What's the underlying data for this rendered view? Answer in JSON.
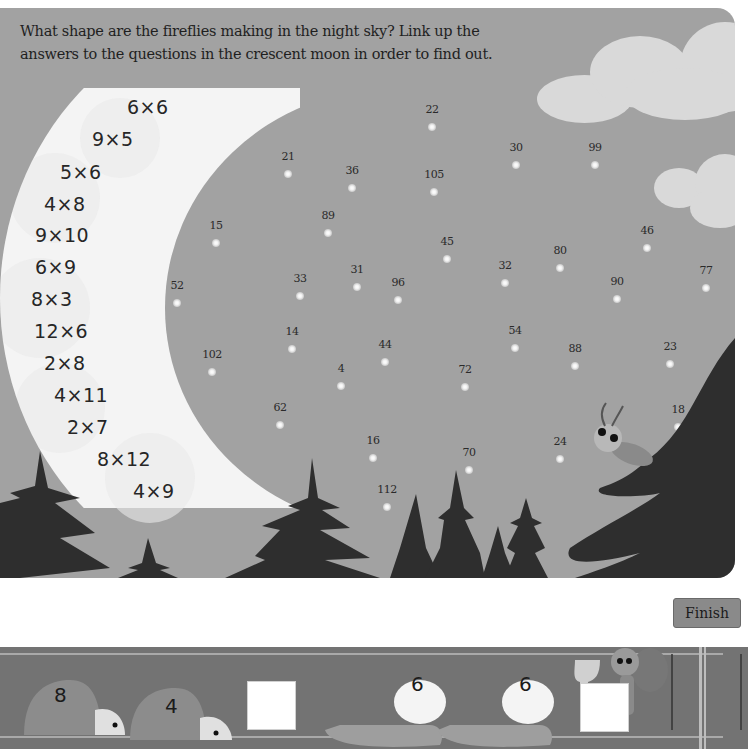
{
  "instructions": {
    "line1": "What shape are the fireflies making in the night sky? Link up the",
    "line2": "answers to the questions in the crescent moon in order to find out."
  },
  "moon_questions": [
    {
      "text": "6×6",
      "x": 127,
      "y": 108
    },
    {
      "text": "9×5",
      "x": 92,
      "y": 140
    },
    {
      "text": "5×6",
      "x": 60,
      "y": 173
    },
    {
      "text": "4×8",
      "x": 44,
      "y": 205
    },
    {
      "text": "9×10",
      "x": 35,
      "y": 236
    },
    {
      "text": "6×9",
      "x": 35,
      "y": 268
    },
    {
      "text": "8×3",
      "x": 31,
      "y": 300
    },
    {
      "text": "12×6",
      "x": 34,
      "y": 332
    },
    {
      "text": "2×8",
      "x": 44,
      "y": 364
    },
    {
      "text": "4×11",
      "x": 54,
      "y": 396
    },
    {
      "text": "2×7",
      "x": 67,
      "y": 428
    },
    {
      "text": "8×12",
      "x": 97,
      "y": 460
    },
    {
      "text": "4×9",
      "x": 133,
      "y": 492
    }
  ],
  "fireflies": [
    {
      "num": "22",
      "x": 432,
      "y": 127
    },
    {
      "num": "30",
      "x": 516,
      "y": 165
    },
    {
      "num": "99",
      "x": 595,
      "y": 165
    },
    {
      "num": "21",
      "x": 288,
      "y": 174
    },
    {
      "num": "36",
      "x": 352,
      "y": 188
    },
    {
      "num": "105",
      "x": 434,
      "y": 192
    },
    {
      "num": "89",
      "x": 328,
      "y": 233
    },
    {
      "num": "15",
      "x": 216,
      "y": 243
    },
    {
      "num": "46",
      "x": 647,
      "y": 248
    },
    {
      "num": "45",
      "x": 447,
      "y": 259
    },
    {
      "num": "80",
      "x": 560,
      "y": 268
    },
    {
      "num": "32",
      "x": 505,
      "y": 283
    },
    {
      "num": "77",
      "x": 706,
      "y": 288
    },
    {
      "num": "31",
      "x": 357,
      "y": 287
    },
    {
      "num": "33",
      "x": 300,
      "y": 296
    },
    {
      "num": "96",
      "x": 398,
      "y": 300
    },
    {
      "num": "90",
      "x": 617,
      "y": 299
    },
    {
      "num": "52",
      "x": 177,
      "y": 303
    },
    {
      "num": "14",
      "x": 292,
      "y": 349
    },
    {
      "num": "54",
      "x": 515,
      "y": 348
    },
    {
      "num": "88",
      "x": 575,
      "y": 366
    },
    {
      "num": "23",
      "x": 670,
      "y": 364
    },
    {
      "num": "102",
      "x": 212,
      "y": 372
    },
    {
      "num": "44",
      "x": 385,
      "y": 362
    },
    {
      "num": "4",
      "x": 341,
      "y": 386
    },
    {
      "num": "72",
      "x": 465,
      "y": 387
    },
    {
      "num": "18",
      "x": 678,
      "y": 427
    },
    {
      "num": "62",
      "x": 280,
      "y": 425
    },
    {
      "num": "24",
      "x": 560,
      "y": 459
    },
    {
      "num": "16",
      "x": 373,
      "y": 458
    },
    {
      "num": "70",
      "x": 469,
      "y": 470
    },
    {
      "num": "112",
      "x": 387,
      "y": 507
    }
  ],
  "race": {
    "ladybug_numbers": [
      "8",
      "4"
    ],
    "caterpillar_numbers": [
      "6",
      "6"
    ],
    "finish_label": "Finish"
  },
  "colors": {
    "sky": "#a2a2a2",
    "moon": "#f4f4f4",
    "trees": "#2e2e2e",
    "track": "#737373"
  }
}
